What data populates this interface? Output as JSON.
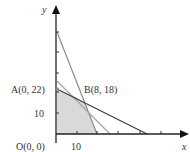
{
  "axes": {
    "x_label": "x",
    "y_label": "y",
    "x_tick_label": "10",
    "y_tick_label": "10"
  },
  "points": {
    "origin": "O(0, 0)",
    "A": "A(0, 22)",
    "B": "B(8, 18)"
  },
  "colors": {
    "axis": "#222222",
    "feasible_region": "#d9d9d9",
    "dark_line": "#444444",
    "light_line": "#9a9a9a",
    "steep_line": "#8c8c8c"
  }
}
